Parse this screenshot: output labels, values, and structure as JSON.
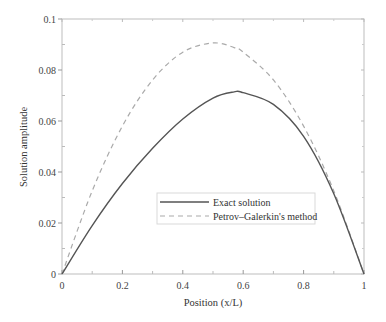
{
  "chart_data": {
    "type": "line",
    "title": "",
    "xlabel": "Position (x/L)",
    "ylabel": "Solution amplitude",
    "xlim": [
      0,
      1
    ],
    "ylim": [
      0,
      0.1
    ],
    "xticks": [
      "0",
      "0.2",
      "0.4",
      "0.6",
      "0.8",
      "1"
    ],
    "yticks": [
      "0",
      "0.02",
      "0.04",
      "0.06",
      "0.08",
      "0.1"
    ],
    "grid": false,
    "legend_position": "lower center",
    "x": [
      0,
      0.1,
      0.2,
      0.3,
      0.4,
      0.5,
      0.57,
      0.6,
      0.7,
      0.8,
      0.9,
      1.0
    ],
    "series": [
      {
        "name": "Exact solution",
        "style": "solid",
        "color": "#555555",
        "values": [
          0,
          0.019,
          0.0355,
          0.0493,
          0.0608,
          0.069,
          0.0714,
          0.0711,
          0.0665,
          0.054,
          0.0315,
          0
        ]
      },
      {
        "name": "Petrov–Galerkin's method",
        "style": "dashed",
        "color": "#aaaaaa",
        "values": [
          0,
          0.0326,
          0.058,
          0.0761,
          0.087,
          0.0906,
          0.0888,
          0.087,
          0.0761,
          0.058,
          0.0326,
          0
        ]
      }
    ]
  }
}
